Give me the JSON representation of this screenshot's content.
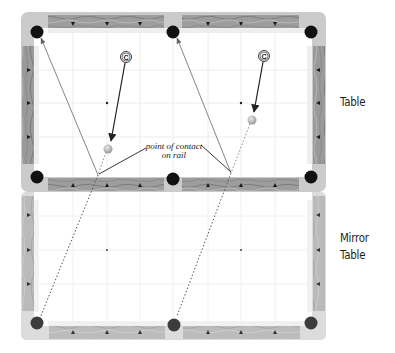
{
  "labels": {
    "table": "Table",
    "mirror_line1": "Mirror",
    "mirror_line2": "Table",
    "annotation_line1": "point of contact",
    "annotation_line2": "on rail",
    "cue_marker": "C"
  },
  "colors": {
    "frame": "#c9c9c9",
    "rail_wood": "#9a9a9a",
    "rail_wood_light": "#bdbdbd",
    "cloth": "#ffffff",
    "cushion": "#ececec",
    "grid": "#eaeaea",
    "pocket": "#111111",
    "pocket_mirror": "#3c3c3c",
    "line": "#555555",
    "arrow": "#222222",
    "ball": "#bdbdbd"
  },
  "tables": [
    {
      "name": "table",
      "pockets": [
        [
          37,
          32
        ],
        [
          173,
          32
        ],
        [
          311,
          32
        ],
        [
          37,
          177
        ],
        [
          173,
          179
        ],
        [
          311,
          177
        ]
      ]
    },
    {
      "name": "mirror-table",
      "pockets": [
        [
          37,
          323
        ],
        [
          174,
          325
        ],
        [
          311,
          323
        ]
      ]
    }
  ],
  "shots": [
    {
      "cue_marker": [
        126,
        57
      ],
      "object_ball": [
        108,
        149
      ],
      "contact_point": [
        98,
        175
      ],
      "target_pocket": [
        37,
        32
      ],
      "mirror_pocket": [
        40,
        318
      ]
    },
    {
      "cue_marker": [
        264,
        56
      ],
      "object_ball": [
        252,
        120
      ],
      "contact_point": [
        231,
        173
      ],
      "target_pocket": [
        173,
        32
      ],
      "mirror_pocket": [
        177,
        316
      ]
    }
  ]
}
